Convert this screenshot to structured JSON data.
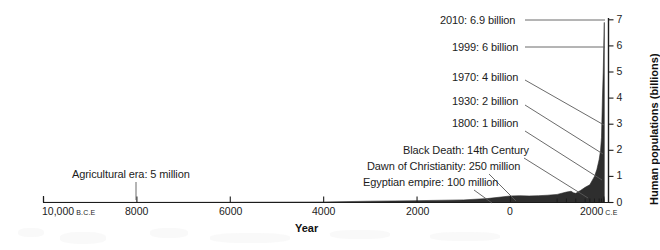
{
  "chart_data": {
    "type": "area",
    "title": "",
    "xlabel": "Year",
    "ylabel": "Human populations (billions)",
    "ylim": [
      0,
      7
    ],
    "xlim": [
      -10000,
      2100
    ],
    "grid": false,
    "legend": "none",
    "x_tick_labels": [
      {
        "text": "10,000",
        "suffix": "B.C.E",
        "value": -10000
      },
      {
        "text": "8000",
        "suffix": "",
        "value": -8000
      },
      {
        "text": "6000",
        "suffix": "",
        "value": -6000
      },
      {
        "text": "4000",
        "suffix": "",
        "value": -4000
      },
      {
        "text": "2000",
        "suffix": "",
        "value": -2000
      },
      {
        "text": "0",
        "suffix": "",
        "value": 0
      },
      {
        "text": "2000",
        "suffix": "C.E",
        "value": 2000
      }
    ],
    "y_tick_labels": [
      "0",
      "1",
      "2",
      "3",
      "4",
      "5",
      "6",
      "7"
    ],
    "minor_x_ticks": [
      1000,
      1200,
      1400,
      1600,
      1700,
      1800,
      1900,
      1950,
      2000
    ],
    "series": [
      {
        "name": "World population",
        "fill": "#2b2b2b",
        "points": [
          {
            "year": -10000,
            "pop": 0.005
          },
          {
            "year": -8000,
            "pop": 0.005
          },
          {
            "year": -6000,
            "pop": 0.01
          },
          {
            "year": -4000,
            "pop": 0.02
          },
          {
            "year": -3000,
            "pop": 0.05
          },
          {
            "year": -2000,
            "pop": 0.07
          },
          {
            "year": -1000,
            "pop": 0.1
          },
          {
            "year": -500,
            "pop": 0.15
          },
          {
            "year": 0,
            "pop": 0.25
          },
          {
            "year": 200,
            "pop": 0.26
          },
          {
            "year": 400,
            "pop": 0.25
          },
          {
            "year": 600,
            "pop": 0.26
          },
          {
            "year": 800,
            "pop": 0.28
          },
          {
            "year": 1000,
            "pop": 0.31
          },
          {
            "year": 1200,
            "pop": 0.4
          },
          {
            "year": 1300,
            "pop": 0.43
          },
          {
            "year": 1350,
            "pop": 0.37
          },
          {
            "year": 1400,
            "pop": 0.35
          },
          {
            "year": 1500,
            "pop": 0.46
          },
          {
            "year": 1600,
            "pop": 0.58
          },
          {
            "year": 1700,
            "pop": 0.68
          },
          {
            "year": 1800,
            "pop": 1.0
          },
          {
            "year": 1850,
            "pop": 1.26
          },
          {
            "year": 1900,
            "pop": 1.65
          },
          {
            "year": 1930,
            "pop": 2.0
          },
          {
            "year": 1950,
            "pop": 2.5
          },
          {
            "year": 1970,
            "pop": 4.0
          },
          {
            "year": 1987,
            "pop": 5.0
          },
          {
            "year": 1999,
            "pop": 6.0
          },
          {
            "year": 2010,
            "pop": 6.9
          }
        ]
      }
    ],
    "annotations": [
      {
        "id": "agricultural-era",
        "label": "Agricultural era: 5 million",
        "value_millions": 5,
        "text_x": 72,
        "text_y": 168,
        "leader": [
          [
            136,
            182
          ],
          [
            136,
            200
          ]
        ]
      },
      {
        "id": "egyptian-empire",
        "label": "Egyptian empire: 100 million",
        "value_millions": 100,
        "text_x": 363,
        "text_y": 176,
        "leader": [
          [
            474,
            190
          ],
          [
            492,
            203
          ]
        ]
      },
      {
        "id": "dawn-of-christianity",
        "label": "Dawn of Christianity: 250 million",
        "value_millions": 250,
        "text_x": 367,
        "text_y": 160,
        "leader": [
          [
            489,
            174
          ],
          [
            516,
            201
          ]
        ]
      },
      {
        "id": "black-death",
        "label": "Black Death: 14th Century",
        "value_millions": null,
        "text_x": 403,
        "text_y": 144,
        "leader": [
          [
            524,
            158
          ],
          [
            588,
            198
          ]
        ]
      },
      {
        "id": "pop-1800",
        "label": "1800: 1 billion",
        "value_billions": 1,
        "text_x": 452,
        "text_y": 117,
        "leader": [
          [
            525,
            131
          ],
          [
            602,
            180
          ]
        ]
      },
      {
        "id": "pop-1930",
        "label": "1930: 2 billion",
        "value_billions": 2,
        "text_x": 452,
        "text_y": 95,
        "leader": [
          [
            525,
            105
          ],
          [
            603,
            154
          ]
        ]
      },
      {
        "id": "pop-1970",
        "label": "1970: 4 billion",
        "value_billions": 4,
        "text_x": 452,
        "text_y": 71,
        "leader": [
          [
            525,
            80
          ],
          [
            604,
            125
          ]
        ]
      },
      {
        "id": "pop-1999",
        "label": "1999: 6 billion",
        "value_billions": 6,
        "text_x": 452,
        "text_y": 41,
        "leader": [
          [
            525,
            47
          ],
          [
            605,
            47
          ]
        ]
      },
      {
        "id": "pop-2010",
        "label": "2010: 6.9 billion",
        "value_billions": 6.9,
        "text_x": 440,
        "text_y": 14,
        "leader": [
          [
            525,
            20
          ],
          [
            605,
            20
          ]
        ]
      }
    ]
  },
  "axis": {
    "x_title": "Year",
    "y_title": "Human populations (billions)"
  }
}
